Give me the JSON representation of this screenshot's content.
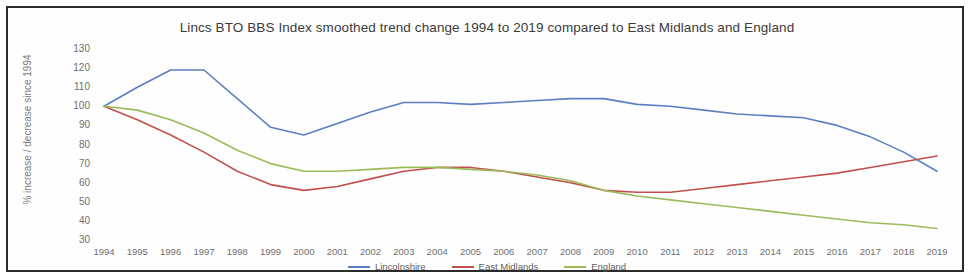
{
  "chart_data": {
    "type": "line",
    "title": "Lincs BTO BBS Index smoothed trend change 1994 to 2019 compared to East Midlands and England",
    "xlabel": "",
    "ylabel": "% increase / decrease since 1994",
    "x": [
      1994,
      1995,
      1996,
      1997,
      1998,
      1999,
      2000,
      2001,
      2002,
      2003,
      2004,
      2005,
      2006,
      2007,
      2008,
      2009,
      2010,
      2011,
      2012,
      2013,
      2014,
      2015,
      2016,
      2017,
      2018,
      2019
    ],
    "xlim": [
      1994,
      2019
    ],
    "ylim": [
      30,
      130
    ],
    "yticks": [
      30,
      40,
      50,
      60,
      70,
      80,
      90,
      100,
      110,
      120,
      130
    ],
    "grid": false,
    "legend_position": "bottom",
    "series": [
      {
        "name": "Lincolnshire",
        "color": "#5b7fc2",
        "values": [
          100,
          110,
          119,
          119,
          104,
          89,
          85,
          91,
          97,
          102,
          102,
          101,
          102,
          103,
          104,
          104,
          101,
          100,
          98,
          96,
          95,
          94,
          90,
          84,
          76,
          66
        ]
      },
      {
        "name": "East Midlands",
        "color": "#c0504d",
        "values": [
          100,
          93,
          85,
          76,
          66,
          59,
          56,
          58,
          62,
          66,
          68,
          68,
          66,
          63,
          60,
          56,
          55,
          55,
          57,
          59,
          61,
          63,
          65,
          68,
          71,
          74
        ]
      },
      {
        "name": "England",
        "color": "#9bbb59",
        "values": [
          100,
          98,
          93,
          86,
          77,
          70,
          66,
          66,
          67,
          68,
          68,
          67,
          66,
          64,
          61,
          56,
          53,
          51,
          49,
          47,
          45,
          43,
          41,
          39,
          38,
          36
        ]
      }
    ]
  },
  "legend": {
    "items": [
      {
        "label": "Lincolnshire",
        "color": "#5b7fc2"
      },
      {
        "label": "East Midlands",
        "color": "#c0504d"
      },
      {
        "label": "England",
        "color": "#9bbb59"
      }
    ]
  }
}
